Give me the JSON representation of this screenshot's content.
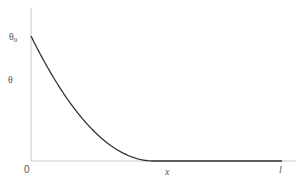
{
  "chart_data": {
    "type": "line",
    "title": "",
    "xlabel": "x",
    "ylabel": "θ",
    "x_ticks": [
      {
        "position": 0,
        "label": "0"
      },
      {
        "position": 1,
        "label": "l"
      }
    ],
    "y_ticks": [
      {
        "position": 0,
        "label": "0"
      },
      {
        "position": 1,
        "label": "θ0"
      }
    ],
    "xlim": [
      0,
      1
    ],
    "ylim": [
      0,
      1.2
    ],
    "grid": false,
    "legend": null,
    "series": [
      {
        "name": "θ(x)",
        "color": "#333333",
        "x": [
          0,
          0.05,
          0.1,
          0.15,
          0.2,
          0.25,
          0.3,
          0.35,
          0.4,
          0.45,
          0.49,
          0.6,
          0.8,
          1.0
        ],
        "values": [
          1.0,
          0.808,
          0.633,
          0.479,
          0.35,
          0.24,
          0.15,
          0.081,
          0.034,
          0.006,
          0.0,
          0.0,
          0.0,
          0.0
        ]
      }
    ]
  },
  "labels": {
    "y_top_main": "θ",
    "y_top_sub": "0",
    "y_axis": "θ",
    "origin": "0",
    "x_axis": "x",
    "x_end": "l"
  },
  "colors": {
    "axis": "#c8c8c8",
    "curve": "#333333",
    "label": "#555555"
  }
}
